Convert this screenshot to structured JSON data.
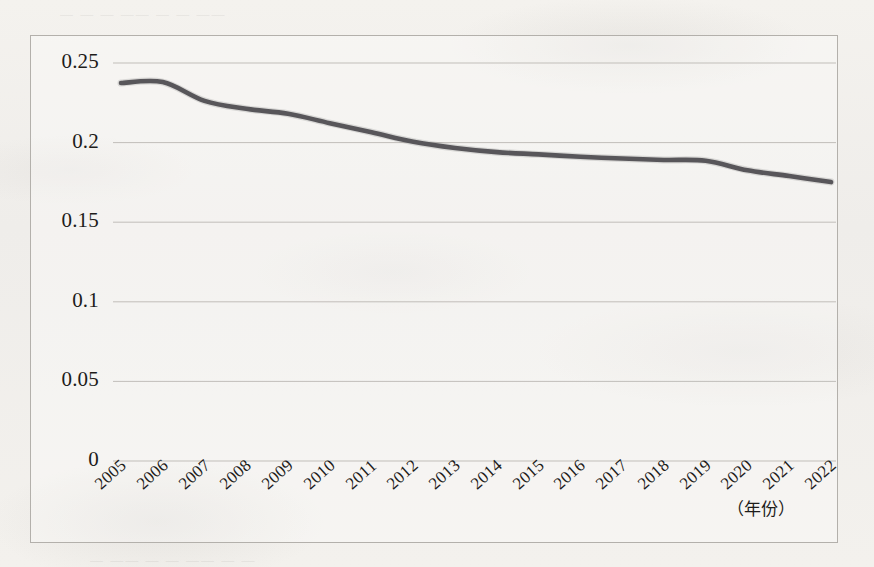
{
  "chart_data": {
    "type": "line",
    "title": "",
    "subtitle": "",
    "xlabel": "（年份）",
    "ylabel": "",
    "categories": [
      "2005",
      "2006",
      "2007",
      "2008",
      "2009",
      "2010",
      "2011",
      "2012",
      "2013",
      "2014",
      "2015",
      "2016",
      "2017",
      "2018",
      "2019",
      "2020",
      "2021",
      "2022"
    ],
    "x": [
      2005,
      2006,
      2007,
      2008,
      2009,
      2010,
      2011,
      2012,
      2013,
      2014,
      2015,
      2016,
      2017,
      2018,
      2019,
      2020,
      2021,
      2022
    ],
    "values": [
      0.2374,
      0.238,
      0.2262,
      0.2212,
      0.2181,
      0.2122,
      0.2065,
      0.2005,
      0.1966,
      0.194,
      0.1926,
      0.1911,
      0.19,
      0.1891,
      0.1886,
      0.1826,
      0.179,
      0.1752
    ],
    "series": [
      {
        "name": "",
        "values": [
          0.2374,
          0.238,
          0.2262,
          0.2212,
          0.2181,
          0.2122,
          0.2065,
          0.2005,
          0.1966,
          0.194,
          0.1926,
          0.1911,
          0.19,
          0.1891,
          0.1886,
          0.1826,
          0.179,
          0.1752
        ]
      }
    ],
    "ylim": [
      0,
      0.25
    ],
    "yticks": [
      0,
      0.05,
      0.1,
      0.15,
      0.2,
      0.25
    ],
    "ytick_labels": [
      "0",
      "0.05",
      "0.1",
      "0.15",
      "0.2",
      "0.25"
    ],
    "xlim": [
      2005,
      2022
    ],
    "grid": true,
    "grid_axis": "y",
    "legend": false,
    "legend_position": "none",
    "annotations": [],
    "line_color": "#58565a",
    "grid_color": "#b9b6b1",
    "border_color": "#b3b0ab",
    "background_color": "#f2f0ec"
  },
  "axis": {
    "x_title": "（年份）",
    "ytick_labels": [
      "0.25",
      "0.2",
      "0.15",
      "0.1",
      "0.05",
      "0"
    ],
    "xtick_labels": [
      "2005",
      "2006",
      "2007",
      "2008",
      "2009",
      "2010",
      "2011",
      "2012",
      "2013",
      "2014",
      "2015",
      "2016",
      "2017",
      "2018",
      "2019",
      "2020",
      "2021",
      "2022"
    ]
  },
  "page": {
    "bleed_top": "— — — —— — — ——",
    "bleed_bottom": "— —— — — —— — —"
  }
}
